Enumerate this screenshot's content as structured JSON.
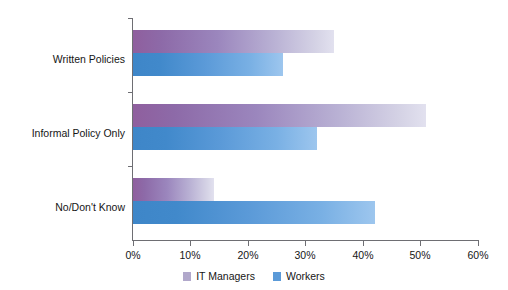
{
  "chart_data": {
    "type": "bar",
    "orientation": "horizontal",
    "title": "",
    "subtitle": "",
    "xlabel": "",
    "ylabel": "",
    "categories": [
      "Written Policies",
      "Informal Policy Only",
      "No/Don't Know"
    ],
    "series": [
      {
        "name": "IT Managers",
        "color": "#b1a8cb",
        "values": [
          35,
          51,
          14
        ]
      },
      {
        "name": "Workers",
        "color": "#5b9ad8",
        "values": [
          26,
          32,
          42
        ]
      }
    ],
    "xlim": [
      0,
      60
    ],
    "xtick_values": [
      0,
      10,
      20,
      30,
      40,
      50,
      60
    ],
    "xtick_labels": [
      "0%",
      "10%",
      "20%",
      "30%",
      "40%",
      "50%",
      "60%"
    ],
    "grid": false,
    "legend_position": "bottom-center",
    "value_unit": "%",
    "annotations": []
  },
  "legend": {
    "items": [
      {
        "label": "IT Managers",
        "swatch": "legend-swatch-it-managers"
      },
      {
        "label": "Workers",
        "swatch": "legend-swatch-workers"
      }
    ]
  },
  "colors": {
    "managers_accent": "#8f5f9e",
    "managers_fade": "#e2e1ef",
    "workers_accent": "#3e86c8",
    "workers_fade": "#9dc6ee",
    "axis": "#6e6e73",
    "text": "#161616",
    "background": "#ffffff"
  }
}
